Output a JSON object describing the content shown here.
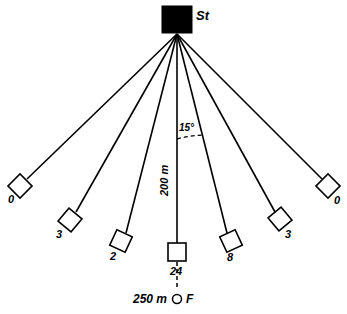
{
  "diagram": {
    "type": "ray-fan-survey",
    "title_label": "St",
    "source": {
      "name": "St",
      "label": "St",
      "shape": "filled-rectangle"
    },
    "angle_annotation": {
      "value": "15°",
      "between": [
        "vertical-ray",
        "ray-right-1"
      ]
    },
    "vertical_distance": {
      "label": "200 m",
      "along": "vertical-ray"
    },
    "focus_point": {
      "label": "F",
      "distance_label": "250 m",
      "shape": "open-circle"
    },
    "receivers": [
      {
        "id": "r-left-3",
        "label": "0",
        "cx": 20,
        "cy": 186,
        "rotated": true,
        "size": 17,
        "label_x": 8,
        "label_y": 203
      },
      {
        "id": "r-left-2",
        "label": "3",
        "cx": 70,
        "cy": 220,
        "rotated": true,
        "size": 17,
        "label_x": 56,
        "label_y": 238
      },
      {
        "id": "r-left-1",
        "label": "2",
        "cx": 121,
        "cy": 241,
        "rotated": true,
        "size": 17,
        "label_x": 110,
        "label_y": 260
      },
      {
        "id": "r-center",
        "label": "24",
        "cx": 177,
        "cy": 252,
        "rotated": false,
        "size": 18,
        "label_x": 170,
        "label_y": 273
      },
      {
        "id": "r-right-1",
        "label": "8",
        "cx": 231,
        "cy": 241,
        "rotated": true,
        "size": 17,
        "label_x": 227,
        "label_y": 261
      },
      {
        "id": "r-right-2",
        "label": "3",
        "cx": 280,
        "cy": 219,
        "rotated": true,
        "size": 17,
        "label_x": 285,
        "label_y": 238
      },
      {
        "id": "r-right-3",
        "label": "0",
        "cx": 328,
        "cy": 186,
        "rotated": true,
        "size": 17,
        "label_x": 334,
        "label_y": 204
      }
    ],
    "colors": {
      "stroke": "#000000",
      "fill_source": "#000000",
      "fill_receiver": "#ffffff",
      "background": "#ffffff"
    }
  }
}
